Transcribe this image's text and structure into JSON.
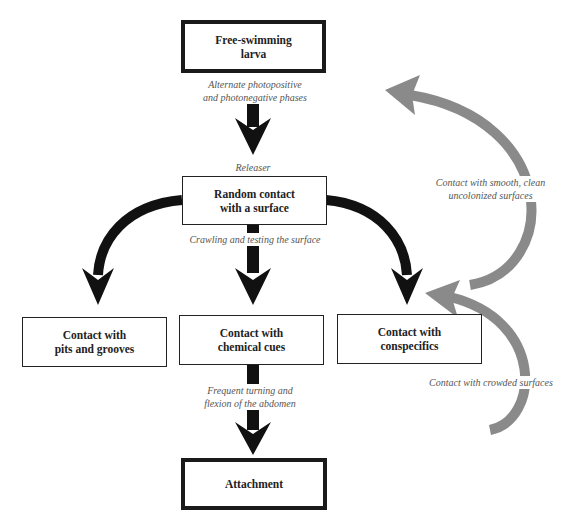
{
  "nodes": {
    "larva": {
      "line1": "Free-swimming",
      "line2": "larva"
    },
    "random": {
      "line1": "Random contact",
      "line2": "with a surface"
    },
    "pits": {
      "line1": "Contact with",
      "line2": "pits and grooves"
    },
    "chemical": {
      "line1": "Contact with",
      "line2": "chemical cues"
    },
    "conspecifics": {
      "line1": "Contact with",
      "line2": "conspecifics"
    },
    "attachment": {
      "line1": "Attachment"
    }
  },
  "edge_labels": {
    "phases": {
      "line1": "Alternate photopositive",
      "line2": "and photonegative phases"
    },
    "releaser": "Releaser",
    "crawling": "Crawling and testing the surface",
    "turning": {
      "line1": "Frequent turning and",
      "line2": "flexion of the abdomen"
    },
    "smooth": {
      "line1": "Contact with smooth, clean",
      "line2": "uncolonized surfaces"
    },
    "crowded": "Contact with crowded surfaces"
  },
  "colors": {
    "main_arrow": "#111111",
    "feedback_arrow": "#8a8a8a"
  }
}
